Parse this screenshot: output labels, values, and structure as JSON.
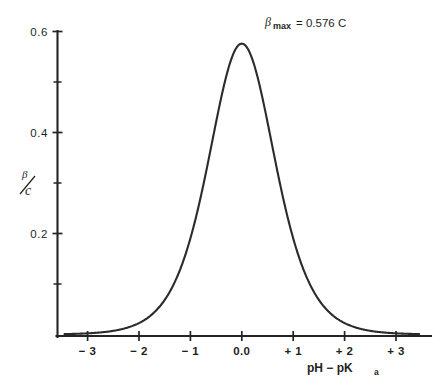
{
  "chart_data": {
    "type": "line",
    "title": "",
    "subtitle": "",
    "xlabel": "pH −  pK",
    "xlabel_sub": "a",
    "ylabel_numerator": "β",
    "ylabel_denominator": "c",
    "ylabel": "β/c",
    "xlim": [
      -3.45,
      3.45
    ],
    "ylim": [
      0,
      0.63
    ],
    "grid": false,
    "legend": null,
    "x_ticks": [
      -3,
      -2,
      -1,
      0,
      1,
      2,
      3
    ],
    "x_tick_labels": [
      "− 3",
      "− 2",
      "− 1",
      "0.0",
      "+ 1",
      "+ 2",
      "+ 3"
    ],
    "y_ticks": [
      0.2,
      0.4,
      0.6
    ],
    "y_tick_labels": [
      "0.2",
      "0.4",
      "0.6"
    ],
    "y_minor_ticks": [
      0.1,
      0.3,
      0.5
    ],
    "annotation": {
      "symbol": "β",
      "subscript": "max",
      "text": "= 0.576 C",
      "full": "βmax = 0.576 C",
      "value": 0.576,
      "unit": "C"
    },
    "series": [
      {
        "name": "buffer capacity",
        "formula": "beta/c = 2.303 * 10^x / (1 + 10^x)^2",
        "peak_x": 0.0,
        "peak_y": 0.576,
        "x": [
          -3.45,
          -3.3,
          -3.15,
          -3.0,
          -2.85,
          -2.7,
          -2.55,
          -2.4,
          -2.25,
          -2.1,
          -1.95,
          -1.8,
          -1.65,
          -1.5,
          -1.35,
          -1.2,
          -1.05,
          -0.9,
          -0.75,
          -0.6,
          -0.45,
          -0.3,
          -0.15,
          0.0,
          0.15,
          0.3,
          0.45,
          0.6,
          0.75,
          0.9,
          1.05,
          1.2,
          1.35,
          1.5,
          1.65,
          1.8,
          1.95,
          2.1,
          2.25,
          2.4,
          2.55,
          2.7,
          2.85,
          3.0,
          3.15,
          3.3,
          3.45
        ],
        "y": [
          0.0008,
          0.0012,
          0.0016,
          0.0023,
          0.0032,
          0.0046,
          0.0064,
          0.0091,
          0.0129,
          0.0182,
          0.0256,
          0.0359,
          0.0501,
          0.0694,
          0.0951,
          0.1284,
          0.1699,
          0.2189,
          0.273,
          0.3282,
          0.3797,
          0.4231,
          0.4554,
          0.576,
          0.4554,
          0.4231,
          0.3797,
          0.3282,
          0.273,
          0.2189,
          0.1699,
          0.1284,
          0.0951,
          0.0694,
          0.0501,
          0.0359,
          0.0256,
          0.0182,
          0.0129,
          0.0091,
          0.0064,
          0.0046,
          0.0032,
          0.0023,
          0.0016,
          0.0012,
          0.0008
        ]
      }
    ],
    "colors": {
      "curve": "#2b2b2b",
      "axis": "#242424",
      "text": "#1f1f1f",
      "background": "#ffffff"
    }
  }
}
